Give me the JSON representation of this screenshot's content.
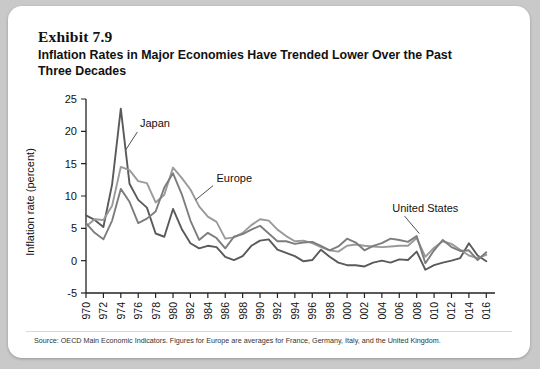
{
  "exhibit": {
    "number": "Exhibit 7.9",
    "title": "Inflation Rates in Major Economies Have Trended Lower Over the Past Three Decades",
    "source": "Source: OECD Main Economic Indicators. Figures for Europe are averages for France, Germany, Italy, and the United Kingdom."
  },
  "colors": {
    "japan": "#5a5a5a",
    "europe": "#9a9a9a",
    "united_states": "#7d7d7d",
    "axis": "#222222",
    "card_background": "#ffffff",
    "page_background": "#c9c9c9"
  },
  "chart_data": {
    "type": "line",
    "title": "Inflation Rates in Major Economies Have Trended Lower Over the Past Three Decades",
    "xlabel": "",
    "ylabel": "Inflation rate (percent)",
    "ylim": [
      -5,
      25
    ],
    "ytick_labels": [
      "25",
      "20",
      "15",
      "10",
      "5",
      "0",
      "-5"
    ],
    "yticks": [
      25,
      20,
      15,
      10,
      5,
      0,
      -5
    ],
    "xlim": [
      1970,
      2017
    ],
    "xtick_labels": [
      "1970",
      "1972",
      "1974",
      "1976",
      "1978",
      "1980",
      "1982",
      "1984",
      "1986",
      "1988",
      "1990",
      "1992",
      "1994",
      "1996",
      "1998",
      "2000",
      "2002",
      "2004",
      "2006",
      "2008",
      "2010",
      "2012",
      "2014",
      "2016"
    ],
    "xticks": [
      1970,
      1972,
      1974,
      1976,
      1978,
      1980,
      1982,
      1984,
      1986,
      1988,
      1990,
      1992,
      1994,
      1996,
      1998,
      2000,
      2002,
      2004,
      2006,
      2008,
      2010,
      2012,
      2014,
      2016
    ],
    "grid": false,
    "legend": "inline-annotations",
    "x": [
      1970,
      1971,
      1972,
      1973,
      1974,
      1975,
      1976,
      1977,
      1978,
      1979,
      1980,
      1981,
      1982,
      1983,
      1984,
      1985,
      1986,
      1987,
      1988,
      1989,
      1990,
      1991,
      1992,
      1993,
      1994,
      1995,
      1996,
      1997,
      1998,
      1999,
      2000,
      2001,
      2002,
      2003,
      2004,
      2005,
      2006,
      2007,
      2008,
      2009,
      2010,
      2011,
      2012,
      2013,
      2014,
      2015,
      2016
    ],
    "series": [
      {
        "name": "Japan",
        "color": "#5a5a5a",
        "values": [
          7.0,
          6.3,
          5.2,
          11.8,
          23.5,
          11.9,
          9.4,
          8.2,
          4.2,
          3.7,
          8.0,
          4.9,
          2.7,
          1.9,
          2.3,
          2.1,
          0.6,
          0.1,
          0.7,
          2.3,
          3.1,
          3.3,
          1.7,
          1.2,
          0.7,
          -0.1,
          0.1,
          1.7,
          0.6,
          -0.3,
          -0.7,
          -0.7,
          -0.9,
          -0.3,
          0.0,
          -0.3,
          0.2,
          0.1,
          1.4,
          -1.4,
          -0.7,
          -0.3,
          0.0,
          0.4,
          2.7,
          0.8,
          -0.1
        ]
      },
      {
        "name": "Europe",
        "color": "#9a9a9a",
        "values": [
          5.3,
          6.4,
          6.3,
          8.5,
          14.5,
          14.0,
          12.3,
          12.0,
          9.0,
          10.2,
          14.4,
          12.8,
          11.0,
          8.4,
          6.8,
          6.0,
          3.4,
          3.6,
          4.3,
          5.5,
          6.4,
          6.2,
          4.8,
          3.8,
          3.0,
          3.1,
          2.7,
          2.1,
          1.6,
          1.4,
          2.3,
          2.5,
          2.3,
          2.2,
          2.1,
          2.2,
          2.3,
          2.3,
          3.5,
          0.6,
          2.0,
          3.0,
          2.6,
          1.7,
          0.8,
          0.4,
          0.9
        ]
      },
      {
        "name": "United States",
        "color": "#7d7d7d",
        "values": [
          5.8,
          4.3,
          3.3,
          6.2,
          11.1,
          9.1,
          5.8,
          6.5,
          7.6,
          11.3,
          13.5,
          10.3,
          6.2,
          3.2,
          4.3,
          3.5,
          1.9,
          3.7,
          4.1,
          4.8,
          5.4,
          4.2,
          3.0,
          3.0,
          2.6,
          2.8,
          2.9,
          2.3,
          1.6,
          2.2,
          3.4,
          2.8,
          1.6,
          2.3,
          2.7,
          3.4,
          3.2,
          2.9,
          3.8,
          -0.4,
          1.6,
          3.2,
          2.1,
          1.5,
          1.6,
          0.1,
          1.3
        ]
      }
    ],
    "annotations": [
      {
        "label": "Japan",
        "x": 1976.2,
        "y": 20.6
      },
      {
        "label": "Europe",
        "x": 1985.0,
        "y": 12.2
      },
      {
        "label": "United States",
        "x": 2005.2,
        "y": 7.6
      }
    ]
  }
}
